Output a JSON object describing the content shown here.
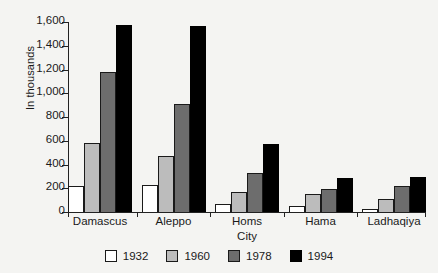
{
  "chart_data": {
    "type": "bar",
    "title": "",
    "xlabel": "City",
    "ylabel": "In thousands",
    "ylim": [
      0,
      1600
    ],
    "ytick_step": 200,
    "grid": false,
    "legend_position": "bottom",
    "categories": [
      "Damascus",
      "Aleppo",
      "Homs",
      "Hama",
      "Ladhaqiya"
    ],
    "ytick_labels": [
      "1,600",
      "1,400",
      "1,200",
      "1,000",
      "800",
      "600",
      "400",
      "200",
      "0"
    ],
    "ytick_values": [
      1600,
      1400,
      1200,
      1000,
      800,
      600,
      400,
      200,
      0
    ],
    "series": [
      {
        "name": "1932",
        "color": "#ffffff",
        "values": [
          215,
          230,
          70,
          50,
          25
        ]
      },
      {
        "name": "1960",
        "color": "#bcbcbc",
        "values": [
          585,
          470,
          165,
          155,
          110
        ]
      },
      {
        "name": "1978",
        "color": "#6d6d6d",
        "values": [
          1180,
          910,
          330,
          195,
          215
        ]
      },
      {
        "name": "1994",
        "color": "#000000",
        "values": [
          1575,
          1565,
          575,
          285,
          295
        ]
      }
    ]
  }
}
